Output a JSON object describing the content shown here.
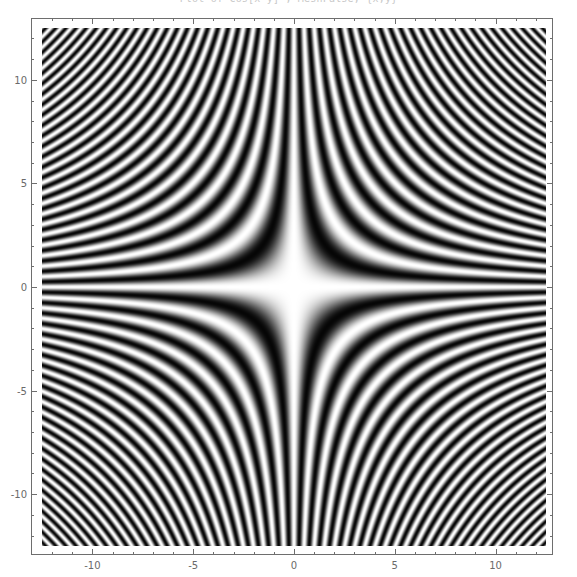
{
  "figure": {
    "title": "Plot of Cos[x y] , MeshFalse, {x,y}",
    "title_clipped": true,
    "width": 577,
    "height": 577,
    "background": "#ffffff",
    "frame_color": "#6e6e6e",
    "label_color": "#6a6a6a"
  },
  "chart_data": {
    "type": "heatmap",
    "title": "Plot of Cos[x y] , MeshFalse, {x,y}",
    "xlabel": "",
    "ylabel": "",
    "function": "Cos[x*y]",
    "colormap": "grayscale",
    "colormap_low": "#0a0a0a",
    "colormap_high": "#ffffff",
    "value_range": [
      -1,
      1
    ],
    "xlim": [
      -12.5,
      12.5
    ],
    "ylim": [
      -12.5,
      12.5
    ],
    "grid": false,
    "legend": "none",
    "samples": 504,
    "x_major_ticks": [
      -10,
      -5,
      0,
      5,
      10
    ],
    "x_major_tick_labels": [
      "-10",
      "-5",
      "0",
      "5",
      "10"
    ],
    "x_minor_ticks": [
      -12,
      -11,
      -9,
      -8,
      -7,
      -6,
      -4,
      -3,
      -2,
      -1,
      1,
      2,
      3,
      4,
      6,
      7,
      8,
      9,
      11,
      12
    ],
    "y_major_ticks": [
      -10,
      -5,
      0,
      5,
      10
    ],
    "y_major_tick_labels": [
      "-10",
      "-5",
      "0",
      "5",
      "10"
    ],
    "y_minor_ticks": [
      -12,
      -11,
      -9,
      -8,
      -7,
      -6,
      -4,
      -3,
      -2,
      -1,
      1,
      2,
      3,
      4,
      6,
      7,
      8,
      9,
      11,
      12
    ],
    "frame": true,
    "frame_ticks_all_sides": true,
    "sample_values": [
      {
        "x": 0,
        "y": 0,
        "value": 1
      },
      {
        "x": 0,
        "y": 12.5,
        "value": 1
      },
      {
        "x": 12.5,
        "y": 0,
        "value": 1
      },
      {
        "x": -12.5,
        "y": 0,
        "value": 1
      },
      {
        "x": 0,
        "y": -12.5,
        "value": 1
      },
      {
        "x": 1.772,
        "y": 1.772,
        "value": -1
      },
      {
        "x": 2.507,
        "y": 2.507,
        "value": 1
      },
      {
        "x": 12.5,
        "y": 12.5,
        "value": -0.3
      },
      {
        "x": -12.5,
        "y": 12.5,
        "value": -0.3
      },
      {
        "x": 5,
        "y": 5,
        "value": -0.991
      },
      {
        "x": -5,
        "y": 5,
        "value": -0.991
      },
      {
        "x": 10,
        "y": 10,
        "value": -0.952
      },
      {
        "x": 3,
        "y": 1,
        "value": -0.99
      },
      {
        "x": 2,
        "y": 2,
        "value": -0.654
      }
    ]
  }
}
